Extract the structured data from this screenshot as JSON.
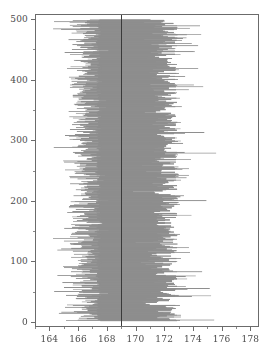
{
  "chart_data": {
    "type": "bar",
    "orientation": "horizontal",
    "title": "",
    "subtitle": "",
    "xlabel": "",
    "ylabel": "",
    "xlim": [
      163.0,
      178.6
    ],
    "ylim": [
      -8,
      508
    ],
    "grid": false,
    "legend": null,
    "annotations": [],
    "xticks": [
      164,
      166,
      168,
      170,
      172,
      174,
      176,
      178
    ],
    "xticklabels": [
      "164",
      "166",
      "168",
      "170",
      "172",
      "174",
      "176",
      "178"
    ],
    "yticks": [
      0,
      100,
      200,
      300,
      400,
      500
    ],
    "yticklabels": [
      "0",
      "100",
      "200",
      "300",
      "400",
      "500"
    ],
    "bar_color": "#8e8e8e",
    "reference_line": {
      "orientation": "vertical",
      "value": 169.0,
      "color": "#3a3a3a"
    },
    "series_description": "500 horizontal interval bars, one per index 1..500, each spanning a lower and upper bound around the reference value 169",
    "bar_count": 500,
    "bar_lower_mean": 166.3,
    "bar_upper_mean": 172.0,
    "core_dense_range": [
      167.6,
      172.7
    ],
    "sample_intervals": [
      [
        165.1,
        172.7
      ],
      [
        165.6,
        172.7
      ],
      [
        166.4,
        172.7
      ],
      [
        165.0,
        172.7
      ],
      [
        166.9,
        173.9
      ],
      [
        165.9,
        172.7
      ],
      [
        166.2,
        174.6
      ],
      [
        165.4,
        172.7
      ],
      [
        166.7,
        172.7
      ],
      [
        165.2,
        173.2
      ],
      [
        166.0,
        175.1
      ],
      [
        165.8,
        172.7
      ],
      [
        167.1,
        172.7
      ],
      [
        165.3,
        172.9
      ],
      [
        166.5,
        173.4
      ],
      [
        164.9,
        172.7
      ],
      [
        166.8,
        174.0
      ],
      [
        165.7,
        172.7
      ],
      [
        167.3,
        172.7
      ],
      [
        165.5,
        173.6
      ]
    ]
  },
  "axes": {
    "frame_color": "#6b6b6b"
  }
}
